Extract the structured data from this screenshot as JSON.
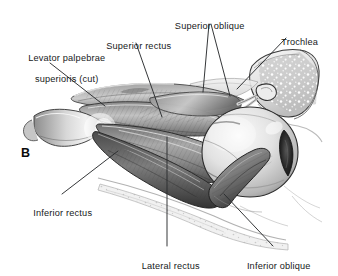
{
  "figure": {
    "panel_letter": "B",
    "palette": {
      "background": "#ffffff",
      "ink": "#17191a",
      "leader_line": "#2a2c2e",
      "muscle_light": "#cfcfcf",
      "muscle_mid": "#9a9a9a",
      "muscle_dark": "#5d5d5d",
      "muscle_deep": "#3a3a3a",
      "sclera": "#e9e9e9",
      "cornea_dark": "#222222",
      "bone_light": "#ededed",
      "bone_stipple": "#a8a8a8",
      "tendon_white": "#f4f4f4"
    }
  },
  "labels": [
    {
      "id": "levator-palpebrae-superioris",
      "line1": "Levator palpebrae",
      "line2": "superioris (cut)",
      "x": 10,
      "y": 42,
      "width": 108,
      "align": "center"
    },
    {
      "id": "superior-rectus",
      "line1": "Superior rectus",
      "line2": "",
      "x": 98,
      "y": 30,
      "width": 76,
      "align": "center"
    },
    {
      "id": "superior-oblique",
      "line1": "Superior oblique",
      "line2": "",
      "x": 164,
      "y": 10,
      "width": 86,
      "align": "center"
    },
    {
      "id": "trochlea",
      "line1": "Trochlea",
      "line2": "",
      "x": 272,
      "y": 26,
      "width": 50,
      "align": "center"
    },
    {
      "id": "inferior-rectus",
      "line1": "Inferior rectus",
      "line2": "",
      "x": 22,
      "y": 197,
      "width": 76,
      "align": "center"
    },
    {
      "id": "lateral-rectus",
      "line1": "Lateral rectus",
      "line2": "",
      "x": 131,
      "y": 250,
      "width": 74,
      "align": "center"
    },
    {
      "id": "inferior-oblique",
      "line1": "Inferior oblique",
      "line2": "",
      "x": 235,
      "y": 250,
      "width": 82,
      "align": "center"
    }
  ],
  "leader_lines": [
    {
      "id": "leader-levator",
      "x1": 50,
      "y1": 63,
      "x2": 105,
      "y2": 106
    },
    {
      "id": "leader-superior-rectus",
      "x1": 136,
      "y1": 43,
      "x2": 162,
      "y2": 117
    },
    {
      "id": "leader-superior-oblique-a",
      "x1": 209,
      "y1": 24,
      "x2": 203,
      "y2": 92
    },
    {
      "id": "leader-superior-oblique-b",
      "x1": 211,
      "y1": 24,
      "x2": 230,
      "y2": 96
    },
    {
      "id": "leader-trochlea",
      "x1": 286,
      "y1": 38,
      "x2": 237,
      "y2": 89
    },
    {
      "id": "leader-inferior-rectus",
      "x1": 62,
      "y1": 194,
      "x2": 118,
      "y2": 151
    },
    {
      "id": "leader-lateral-rectus",
      "x1": 167,
      "y1": 246,
      "x2": 167,
      "y2": 137
    },
    {
      "id": "leader-inferior-oblique",
      "x1": 273,
      "y1": 246,
      "x2": 224,
      "y2": 194
    }
  ]
}
